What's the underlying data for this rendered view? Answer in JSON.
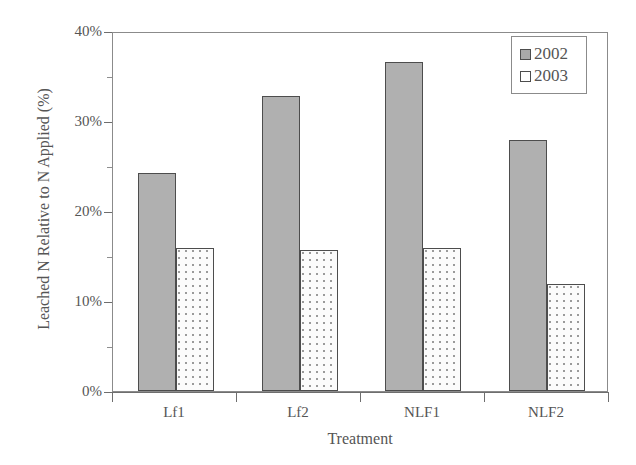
{
  "chart_data": {
    "type": "bar",
    "title": "",
    "subtitle": "",
    "xlabel": "Treatment",
    "ylabel": "Leached N Relative to N Applied (%)",
    "categories": [
      "Lf1",
      "Lf2",
      "NLF1",
      "NLF2"
    ],
    "series": [
      {
        "name": "2002",
        "values": [
          24.4,
          33.0,
          36.8,
          28.0
        ],
        "fill": "#b0b0b0",
        "pattern": "solid-gray-stipple"
      },
      {
        "name": "2003",
        "values": [
          16.0,
          15.7,
          16.0,
          12.0
        ],
        "fill": "#fbfbfb",
        "pattern": "fine-dotted"
      }
    ],
    "ylim": [
      0,
      40
    ],
    "y_ticks": [
      0,
      10,
      20,
      30,
      40
    ],
    "y_tick_labels": [
      "0%",
      "10%",
      "20%",
      "30%",
      "40%"
    ],
    "y_minor_ticks": [
      5,
      15,
      25,
      35
    ],
    "grid": false,
    "legend_position": "top-right",
    "legend_entries": [
      "2002",
      "2003"
    ],
    "frame": "box",
    "border_color": "#8b8b8b",
    "text_color": "#555555"
  },
  "axes": {
    "y_tick_labels": [
      "40%",
      "30%",
      "20%",
      "10%",
      "0%"
    ],
    "x_tick_labels": [
      "Lf1",
      "Lf2",
      "NLF1",
      "NLF2"
    ],
    "x_title": "Treatment",
    "y_title": "Leached N Relative to N Applied (%)"
  },
  "legend": {
    "items": [
      {
        "label": "2002"
      },
      {
        "label": "2003"
      }
    ]
  }
}
